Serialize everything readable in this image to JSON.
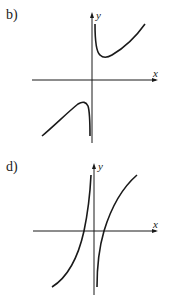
{
  "figures": [
    {
      "id": "b",
      "label": "b)",
      "x_axis_label": "x",
      "y_axis_label": "y",
      "description": "Two branches with vertical asymptote at x=0: upper branch with local minimum in Q1, lower branch with local maximum in Q3"
    },
    {
      "id": "d",
      "label": "d)",
      "x_axis_label": "x",
      "y_axis_label": "y",
      "description": "Two increasing branches with vertical asymptote at x=0, each crossing the x-axis"
    }
  ],
  "colors": {
    "ink": "#1a1a1a",
    "background": "#ffffff"
  }
}
